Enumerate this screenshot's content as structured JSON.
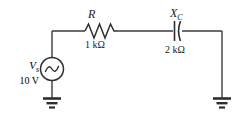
{
  "diagram": {
    "background_color": "#ffffff",
    "line_color": "#3c3c3c",
    "text_color": "#1a1a1a"
  },
  "source": {
    "symbol": "V",
    "subscript": "s",
    "value": "10 V",
    "type": "ac-voltage-source",
    "waveform": "sine"
  },
  "resistor": {
    "symbol": "R",
    "subscript": "",
    "value": "1 kΩ",
    "type": "resistor"
  },
  "capacitor": {
    "symbol": "X",
    "subscript": "C",
    "value": "2 kΩ",
    "type": "capacitor-reactance"
  },
  "grounds": [
    {
      "name": "left-ground",
      "label": ""
    },
    {
      "name": "right-ground",
      "label": ""
    }
  ]
}
